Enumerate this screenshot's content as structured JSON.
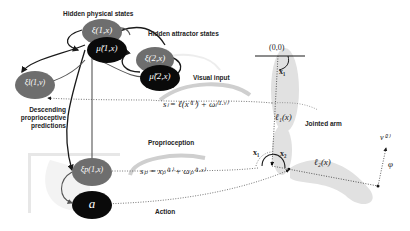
{
  "labels": {
    "hidden_physical": "Hidden physical states",
    "hidden_attractor": "Hidden attractor states",
    "visual_input": "Visual input",
    "descending_1": "Descending",
    "descending_2": "proprioceptive",
    "descending_3": "predictions",
    "proprioception": "Proprioception",
    "action": "Action",
    "jointed_arm": "Jointed arm"
  },
  "nodes": {
    "xi_phys": "ξ(1,x)",
    "mu_1": "μ̃(1,x)",
    "xi_attr": "ξ(2,x)",
    "mu_2": "μ̃(2,x)",
    "xi_l": "ξl(1,v)",
    "xi_p": "ξp(1,x)",
    "action": "a"
  },
  "equations": {
    "visual": "sₗ = ℓ(x⁽¹⁾) + ωₗ⁽¹·ᵛ⁾",
    "proprio": "sₚ = xₚ⁽¹⁾ + ωₚ⁽¹·ˣ⁾"
  },
  "arm": {
    "origin": "(0,0)",
    "x1_top": "x₁",
    "l1": "ℓ₁(x)",
    "x1_joint": "x₁",
    "x2_joint": "x₂",
    "l2": "ℓ₂(x)",
    "v2": "v⁽²⁾",
    "phi": "φ"
  },
  "colors": {
    "gray_node": "#6e6e6e",
    "black_node": "#0a0a0a",
    "line": "#1a1a1a",
    "arm_shade": "#d8d8d8"
  }
}
